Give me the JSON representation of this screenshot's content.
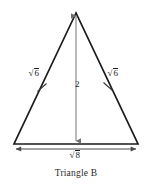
{
  "figure": {
    "caption": "Triangle B",
    "shape": "isosceles-triangle",
    "stroke_color": "#1a1a1a",
    "dimension_color": "#6e6e6e",
    "background_color": "#ffffff",
    "labels": {
      "left_side": {
        "radical": "√",
        "radicand": "6",
        "text": "√6"
      },
      "right_side": {
        "radical": "√",
        "radicand": "6",
        "text": "√6"
      },
      "height": {
        "text": "2"
      },
      "base": {
        "radical": "√",
        "radicand": "8",
        "text": "√8"
      }
    },
    "geometry": {
      "apex": [
        76,
        13
      ],
      "bottom_left": [
        14,
        144
      ],
      "bottom_right": [
        138,
        144
      ],
      "height_foot": [
        76,
        144
      ],
      "base_dimension_line_y": 147,
      "tick_left": [
        42,
        87
      ],
      "tick_right": [
        108,
        86
      ]
    }
  }
}
